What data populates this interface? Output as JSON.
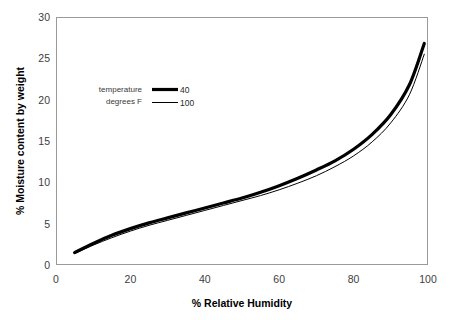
{
  "chart_data": {
    "type": "line",
    "title": "",
    "xlabel": "% Relative Humidity",
    "ylabel": "% Moisture content by weight",
    "xlim": [
      0,
      100
    ],
    "ylim": [
      0,
      30
    ],
    "grid": false,
    "legend_position": "upper-left-inside",
    "legend_title_line1": "temperature",
    "legend_title_line2": "degrees F",
    "xticks": [
      "0",
      "20",
      "40",
      "60",
      "80",
      "100"
    ],
    "xtick_values": [
      0,
      20,
      40,
      60,
      80,
      100
    ],
    "yticks": [
      "0",
      "5",
      "10",
      "15",
      "20",
      "25",
      "30"
    ],
    "ytick_values": [
      0,
      5,
      10,
      15,
      20,
      25,
      30
    ],
    "x": [
      5,
      10,
      15,
      20,
      25,
      30,
      35,
      40,
      45,
      50,
      55,
      60,
      65,
      70,
      75,
      80,
      85,
      90,
      95,
      99
    ],
    "series": [
      {
        "name": "40",
        "label": "40",
        "color": "#000000",
        "line_width": 3.2,
        "values": [
          1.5,
          2.6,
          3.6,
          4.4,
          5.1,
          5.7,
          6.3,
          6.9,
          7.5,
          8.1,
          8.8,
          9.6,
          10.5,
          11.5,
          12.6,
          14.0,
          15.8,
          18.2,
          21.8,
          26.8
        ]
      },
      {
        "name": "100",
        "label": "100",
        "color": "#000000",
        "line_width": 1.0,
        "values": [
          1.4,
          2.4,
          3.3,
          4.1,
          4.8,
          5.4,
          6.0,
          6.6,
          7.2,
          7.8,
          8.4,
          9.1,
          9.9,
          10.8,
          11.9,
          13.2,
          14.9,
          17.2,
          20.6,
          25.5
        ]
      }
    ]
  },
  "axis": {
    "x_title": "% Relative Humidity",
    "y_title": "% Moisture content by weight"
  },
  "legend": {
    "title_line1": "temperature",
    "title_line2": "degrees F",
    "entries": [
      {
        "label": "40",
        "swatch": "thick-line-swatch"
      },
      {
        "label": "100",
        "swatch": "thin-line-swatch"
      }
    ]
  }
}
